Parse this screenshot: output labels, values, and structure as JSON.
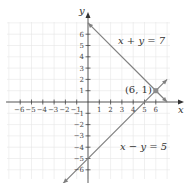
{
  "chart_data": {
    "type": "line",
    "title": "",
    "xlabel": "x",
    "ylabel": "y",
    "xlim": [
      -7,
      7
    ],
    "ylim": [
      -7,
      7
    ],
    "x_ticks": [
      -6,
      -5,
      -4,
      -3,
      -2,
      -1,
      1,
      2,
      3,
      4,
      5,
      6
    ],
    "y_ticks": [
      -6,
      -5,
      -4,
      -3,
      -2,
      -1,
      1,
      2,
      3,
      4,
      5,
      6
    ],
    "grid": true,
    "series": [
      {
        "name": "x + y = 7",
        "label": "x + y = 7",
        "points": [
          [
            0,
            7
          ],
          [
            7,
            0
          ]
        ],
        "color": "#808080"
      },
      {
        "name": "x − y = 5",
        "label": "x − y = 5",
        "points": [
          [
            -2.2,
            -7.2
          ],
          [
            7,
            2
          ]
        ],
        "color": "#808080"
      }
    ],
    "annotations": [
      {
        "label": "(6, 1)",
        "point": [
          6,
          1
        ]
      }
    ],
    "axis_color": "#333333",
    "grid_color": "#e6e6e6",
    "point_color": "#8c8c8c"
  }
}
